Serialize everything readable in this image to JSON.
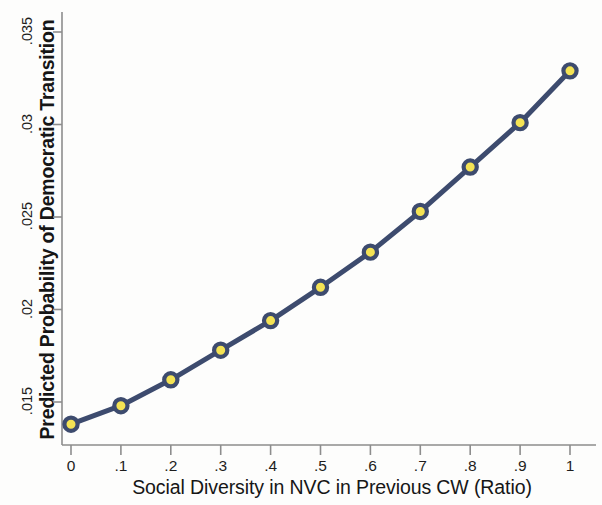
{
  "chart_data": {
    "type": "line",
    "title": "",
    "subtitle": "",
    "xlabel": "Social Diversity in NVC in Previous CW (Ratio)",
    "ylabel": "Predicted Probability of Democratic Transition",
    "x": [
      0,
      0.1,
      0.2,
      0.3,
      0.4,
      0.5,
      0.6,
      0.7,
      0.8,
      0.9,
      1
    ],
    "values": [
      0.0138,
      0.0148,
      0.0162,
      0.0178,
      0.0194,
      0.0212,
      0.0231,
      0.0253,
      0.0277,
      0.0301,
      0.0329
    ],
    "series": [
      {
        "name": "Predicted probability",
        "values": [
          0.0138,
          0.0148,
          0.0162,
          0.0178,
          0.0194,
          0.0212,
          0.0231,
          0.0253,
          0.0277,
          0.0301,
          0.0329
        ]
      }
    ],
    "xlim": [
      0,
      1
    ],
    "ylim": [
      0.0128,
      0.0358
    ],
    "xticks": [
      0,
      0.1,
      0.2,
      0.3,
      0.4,
      0.5,
      0.6,
      0.7,
      0.8,
      0.9,
      1
    ],
    "xtick_labels": [
      "0",
      ".1",
      ".2",
      ".3",
      ".4",
      ".5",
      ".6",
      ".7",
      ".8",
      ".9",
      "1"
    ],
    "yticks": [
      0.015,
      0.02,
      0.025,
      0.03,
      0.035
    ],
    "ytick_labels": [
      ".015",
      ".02",
      ".025",
      ".03",
      ".035"
    ],
    "grid": false,
    "legend": false,
    "legend_position": "none",
    "line_color": "#3d4b6e",
    "marker_fill_color": "#f4e354",
    "marker_edge_color": "#3d4b6e",
    "axis_color": "#8d8d8d",
    "background_color": "#fdfdfc",
    "marker_shape": "circle",
    "line_width": 5,
    "marker_size": 12
  }
}
